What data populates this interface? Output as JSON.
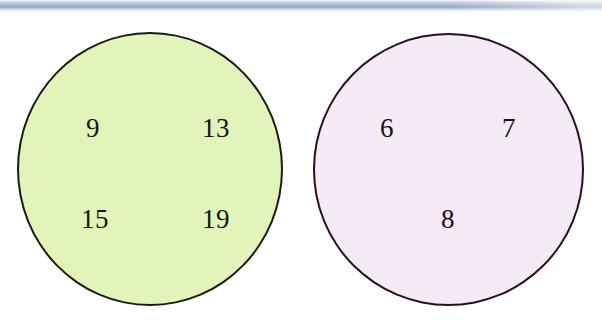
{
  "canvas": {
    "width": 602,
    "height": 332,
    "background": "#ffffff"
  },
  "artifact": {
    "name": "scan-band",
    "description": "faint blue-grey scanned edge band at top",
    "color": "#9fb0cd"
  },
  "figure": {
    "type": "two-set-grouping-diagram",
    "sets": [
      {
        "id": "left",
        "label": "green-set",
        "fill_color": "#e2f4b9",
        "outline_color": "#1b1b14",
        "center": {
          "x": 150,
          "y": 169
        },
        "radius": {
          "x": 133,
          "y": 137
        },
        "items": [
          {
            "value": "9",
            "x": 93,
            "y": 128
          },
          {
            "value": "13",
            "x": 216,
            "y": 128
          },
          {
            "value": "15",
            "x": 95,
            "y": 219
          },
          {
            "value": "19",
            "x": 216,
            "y": 219
          }
        ]
      },
      {
        "id": "right",
        "label": "pink-set",
        "fill_color": "#f7eaf7",
        "outline_color": "#2a1020",
        "center": {
          "x": 448,
          "y": 169
        },
        "radius": {
          "x": 135,
          "y": 136
        },
        "items": [
          {
            "value": "6",
            "x": 387,
            "y": 128
          },
          {
            "value": "7",
            "x": 509,
            "y": 128
          },
          {
            "value": "8",
            "x": 448,
            "y": 219
          }
        ]
      }
    ]
  }
}
